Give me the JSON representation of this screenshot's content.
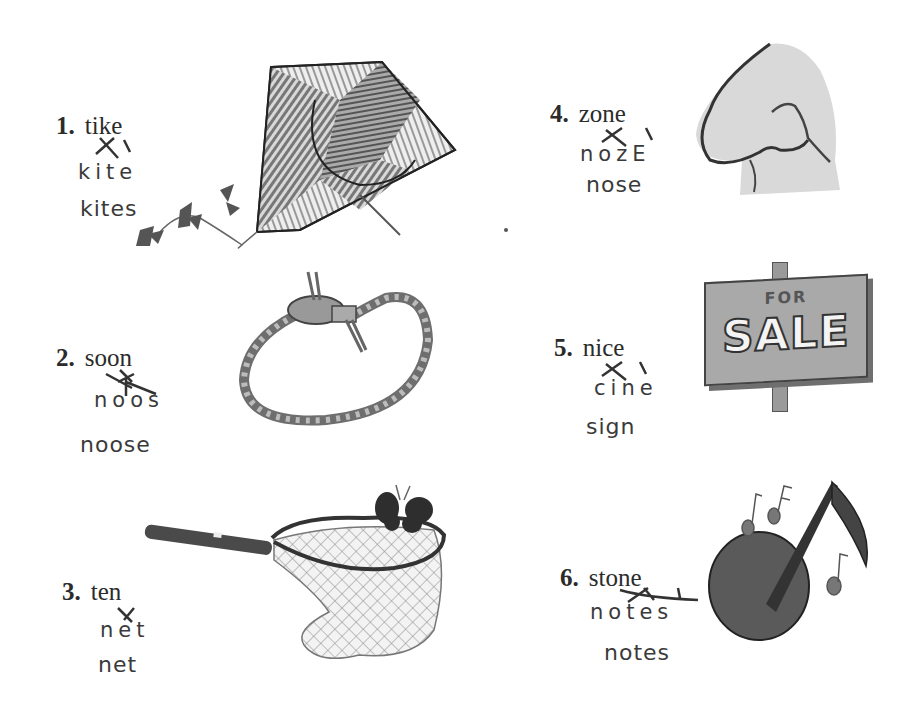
{
  "page": {
    "type": "phonics worksheet - scrambled words",
    "items": [
      {
        "number": "1.",
        "printed_word": "tike",
        "rearranged_letters": "kite",
        "answer": "kites",
        "picture": "kite-illustration"
      },
      {
        "number": "2.",
        "printed_word": "soon",
        "rearranged_letters": "noos",
        "answer": "noose",
        "picture": "noose-rope-illustration"
      },
      {
        "number": "3.",
        "printed_word": "ten",
        "rearranged_letters": "net",
        "answer": "net",
        "picture": "butterfly-net-illustration"
      },
      {
        "number": "4.",
        "printed_word": "zone",
        "rearranged_letters": "nozE",
        "answer": "nose",
        "picture": "nose-illustration"
      },
      {
        "number": "5.",
        "printed_word": "nice",
        "rearranged_letters": "cine",
        "answer": "sign",
        "picture": "for-sale-sign-illustration"
      },
      {
        "number": "6.",
        "printed_word": "stone",
        "rearranged_letters": "notes",
        "answer": "notes",
        "picture": "music-notes-illustration"
      }
    ],
    "sign_text": {
      "top": "FOR",
      "main": "SALE"
    }
  }
}
